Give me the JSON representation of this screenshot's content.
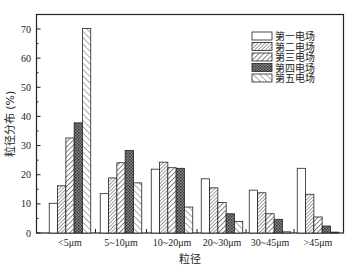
{
  "chart_data": {
    "type": "bar",
    "title": "",
    "xlabel": "粒径",
    "ylabel": "粒径分布 (%)",
    "ylim": [
      0,
      75
    ],
    "yticks": [
      0,
      10,
      20,
      30,
      40,
      50,
      60,
      70
    ],
    "grid": false,
    "legend_position": "upper right",
    "categories": [
      "<5μm",
      "5~10μm",
      "10~20μm",
      "20~30μm",
      "30~45μm",
      ">45μm"
    ],
    "series": [
      {
        "name": "第一电场",
        "pattern": "none",
        "values": [
          10.2,
          13.5,
          21.9,
          18.6,
          14.7,
          22.2
        ]
      },
      {
        "name": "第二电场",
        "pattern": "dense",
        "values": [
          16.2,
          18.9,
          24.3,
          15.5,
          13.8,
          13.3
        ]
      },
      {
        "name": "第三电场",
        "pattern": "diag",
        "values": [
          32.6,
          24.1,
          22.4,
          10.5,
          6.6,
          5.5
        ]
      },
      {
        "name": "第四电场",
        "pattern": "cross",
        "values": [
          37.8,
          28.3,
          22.2,
          6.6,
          4.7,
          2.4
        ]
      },
      {
        "name": "第五电场",
        "pattern": "diag-wide",
        "values": [
          70.2,
          17.2,
          8.9,
          4.0,
          0.4,
          0.3
        ]
      }
    ]
  }
}
